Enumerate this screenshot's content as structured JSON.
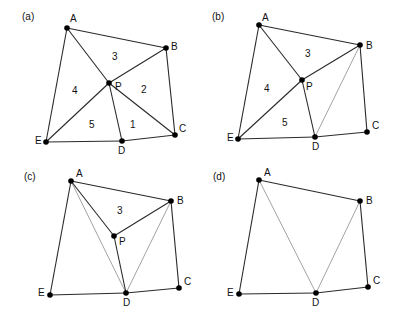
{
  "figure": {
    "panels": [
      {
        "id": "a",
        "label": "(a)",
        "label_pos": [
          22,
          20
        ],
        "vertices": {
          "A": {
            "x": 67,
            "y": 28,
            "label": "A",
            "lx": 3,
            "ly": -6
          },
          "B": {
            "x": 166,
            "y": 48,
            "label": "B",
            "lx": 5,
            "ly": 2
          },
          "C": {
            "x": 175,
            "y": 135,
            "label": "C",
            "lx": 4,
            "ly": -3
          },
          "D": {
            "x": 122,
            "y": 141,
            "label": "D",
            "lx": -4,
            "ly": 13
          },
          "E": {
            "x": 46,
            "y": 142,
            "label": "E",
            "lx": -11,
            "ly": 2
          },
          "P": {
            "x": 109,
            "y": 83,
            "label": "P",
            "lx": 6,
            "ly": 7
          }
        },
        "edges": [
          [
            "A",
            "B"
          ],
          [
            "B",
            "C"
          ],
          [
            "C",
            "D"
          ],
          [
            "D",
            "E"
          ],
          [
            "E",
            "A"
          ],
          [
            "A",
            "P"
          ],
          [
            "B",
            "P"
          ],
          [
            "P",
            "C"
          ],
          [
            "P",
            "D"
          ],
          [
            "P",
            "E"
          ]
        ],
        "thin_edges": [],
        "regions": [
          {
            "label": "1",
            "x": 130,
            "y": 128
          },
          {
            "label": "2",
            "x": 141,
            "y": 93
          },
          {
            "label": "3",
            "x": 112,
            "y": 60
          },
          {
            "label": "4",
            "x": 72,
            "y": 94
          },
          {
            "label": "5",
            "x": 89,
            "y": 128
          }
        ]
      },
      {
        "id": "b",
        "label": "(b)",
        "label_pos": [
          212,
          20
        ],
        "vertices": {
          "A": {
            "x": 259,
            "y": 25,
            "label": "A",
            "lx": 3,
            "ly": -4
          },
          "B": {
            "x": 360,
            "y": 45,
            "label": "B",
            "lx": 6,
            "ly": 4
          },
          "C": {
            "x": 367,
            "y": 132,
            "label": "C",
            "lx": 5,
            "ly": -3
          },
          "D": {
            "x": 315,
            "y": 137,
            "label": "D",
            "lx": -3,
            "ly": 13
          },
          "E": {
            "x": 238,
            "y": 139,
            "label": "E",
            "lx": -11,
            "ly": 2
          },
          "P": {
            "x": 302,
            "y": 80,
            "label": "P",
            "lx": 4,
            "ly": 10
          }
        },
        "edges": [
          [
            "A",
            "B"
          ],
          [
            "B",
            "C"
          ],
          [
            "C",
            "D"
          ],
          [
            "D",
            "E"
          ],
          [
            "E",
            "A"
          ],
          [
            "A",
            "P"
          ],
          [
            "B",
            "P"
          ],
          [
            "P",
            "D"
          ],
          [
            "P",
            "E"
          ]
        ],
        "thin_edges": [
          [
            "B",
            "D"
          ]
        ],
        "regions": [
          {
            "label": "3",
            "x": 305,
            "y": 57
          },
          {
            "label": "4",
            "x": 264,
            "y": 92
          },
          {
            "label": "5",
            "x": 282,
            "y": 126
          }
        ]
      },
      {
        "id": "c",
        "label": "(c)",
        "label_pos": [
          24,
          180
        ],
        "vertices": {
          "A": {
            "x": 71,
            "y": 181,
            "label": "A",
            "lx": 5,
            "ly": -4
          },
          "B": {
            "x": 171,
            "y": 201,
            "label": "B",
            "lx": 6,
            "ly": 3
          },
          "C": {
            "x": 179,
            "y": 288,
            "label": "C",
            "lx": 5,
            "ly": -3
          },
          "D": {
            "x": 126,
            "y": 293,
            "label": "D",
            "lx": -3,
            "ly": 13
          },
          "E": {
            "x": 50,
            "y": 295,
            "label": "E",
            "lx": -12,
            "ly": 1
          },
          "P": {
            "x": 114,
            "y": 236,
            "label": "P",
            "lx": 5,
            "ly": 9
          }
        },
        "edges": [
          [
            "A",
            "B"
          ],
          [
            "B",
            "C"
          ],
          [
            "C",
            "D"
          ],
          [
            "D",
            "E"
          ],
          [
            "E",
            "A"
          ],
          [
            "A",
            "P"
          ],
          [
            "B",
            "P"
          ],
          [
            "P",
            "D"
          ]
        ],
        "thin_edges": [
          [
            "A",
            "D"
          ],
          [
            "B",
            "D"
          ]
        ],
        "regions": [
          {
            "label": "3",
            "x": 117,
            "y": 214
          }
        ]
      },
      {
        "id": "d",
        "label": "(d)",
        "label_pos": [
          213,
          180
        ],
        "vertices": {
          "A": {
            "x": 259,
            "y": 180,
            "label": "A",
            "lx": 5,
            "ly": -4
          },
          "B": {
            "x": 360,
            "y": 201,
            "label": "B",
            "lx": 6,
            "ly": 3
          },
          "C": {
            "x": 368,
            "y": 287,
            "label": "C",
            "lx": 5,
            "ly": -3
          },
          "D": {
            "x": 316,
            "y": 293,
            "label": "D",
            "lx": -4,
            "ly": 13
          },
          "E": {
            "x": 239,
            "y": 294,
            "label": "E",
            "lx": -12,
            "ly": 2
          }
        },
        "edges": [
          [
            "A",
            "B"
          ],
          [
            "B",
            "C"
          ],
          [
            "C",
            "D"
          ],
          [
            "D",
            "E"
          ],
          [
            "E",
            "A"
          ]
        ],
        "thin_edges": [
          [
            "A",
            "D"
          ],
          [
            "B",
            "D"
          ]
        ],
        "regions": []
      }
    ]
  }
}
